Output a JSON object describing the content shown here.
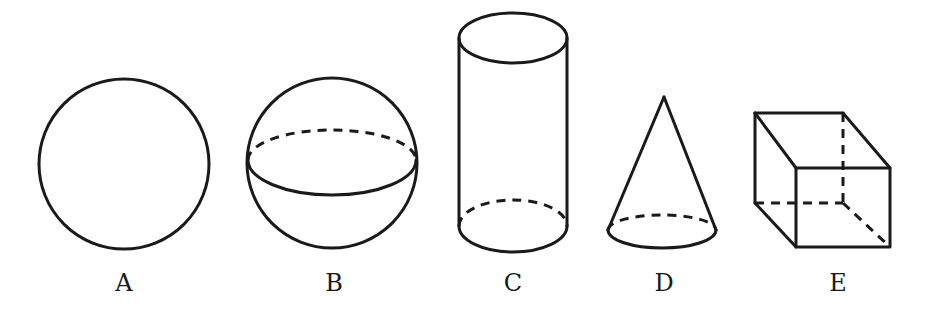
{
  "figure": {
    "shapes": [
      {
        "id": "A",
        "name": "circle",
        "label": "A"
      },
      {
        "id": "B",
        "name": "sphere",
        "label": "B"
      },
      {
        "id": "C",
        "name": "cylinder",
        "label": "C"
      },
      {
        "id": "D",
        "name": "cone",
        "label": "D"
      },
      {
        "id": "E",
        "name": "cube",
        "label": "E"
      }
    ]
  },
  "style": {
    "stroke_color": "#1a1a1a",
    "background": "#ffffff"
  }
}
